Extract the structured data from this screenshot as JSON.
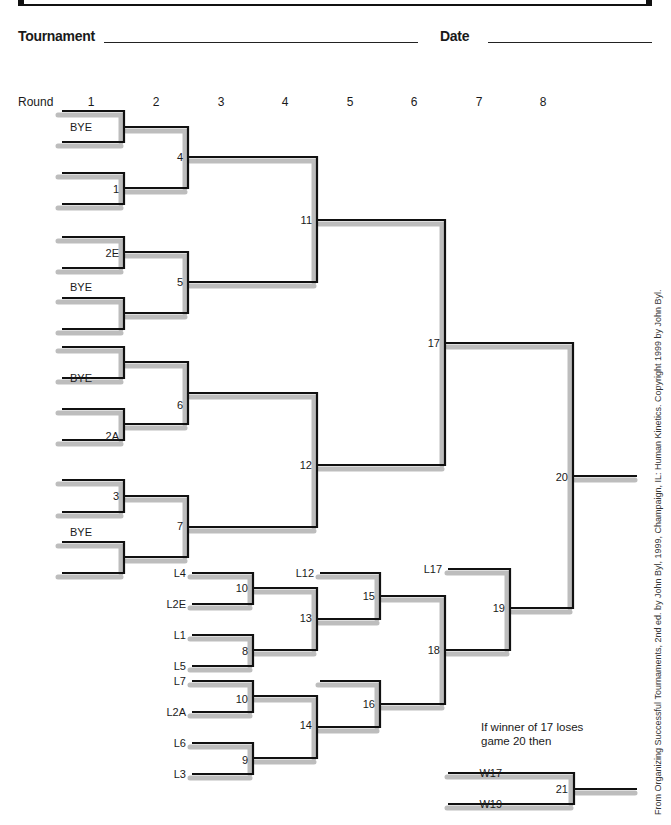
{
  "header": {
    "tournament_label": "Tournament",
    "date_label": "Date",
    "tournament_value": "",
    "date_value": ""
  },
  "rounds": {
    "title": "Round",
    "labels": [
      "1",
      "2",
      "3",
      "4",
      "5",
      "6",
      "7",
      "8"
    ]
  },
  "entries": {
    "r1_bye_a": "BYE",
    "r1_game_1": "1",
    "r1_2e": "2E",
    "r1_bye_b": "BYE",
    "r1_bye_c": "BYE",
    "r1_2a": "2A",
    "r1_game_3": "3",
    "r1_bye_d": "BYE"
  },
  "games": {
    "g4": "4",
    "g5": "5",
    "g6": "6",
    "g7": "7",
    "g11": "11",
    "g12": "12",
    "g17": "17",
    "g20": "20",
    "g10a": "10",
    "g8": "8",
    "g10b": "10",
    "g9": "9",
    "g13": "13",
    "g14": "14",
    "g15": "15",
    "g16": "16",
    "g18": "18",
    "g19": "19",
    "g21": "21"
  },
  "losers_entries": {
    "l4": "L4",
    "l2e": "L2E",
    "l1": "L1",
    "l5": "L5",
    "l7": "L7",
    "l2a": "L2A",
    "l6": "L6",
    "l3": "L3",
    "l12": "L12",
    "l17": "L17",
    "w17": "W17",
    "w19": "W19"
  },
  "note": {
    "line1": "If winner of 17 loses",
    "line2": "game 20 then"
  },
  "credit": "From Organizing Successful Tournaments, 2nd ed. by John Byl, 1999, Champaign, IL: Human Kinetics. Copyright 1999 by John Byl.",
  "colors": {
    "line": "#111111",
    "shadow": "#bdbdbd"
  }
}
